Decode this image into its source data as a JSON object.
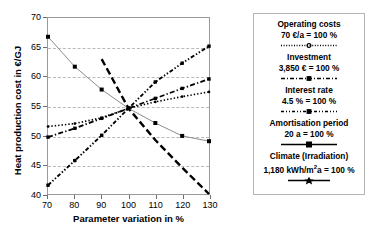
{
  "chart_data": {
    "type": "line",
    "title": "",
    "xlabel": "Parameter variation in %",
    "ylabel": "Heat production cost in €/GJ",
    "xlim": [
      70,
      130
    ],
    "ylim": [
      40,
      70
    ],
    "xticks": [
      70,
      80,
      90,
      100,
      110,
      120,
      130
    ],
    "yticks": [
      40,
      45,
      50,
      55,
      60,
      65,
      70
    ],
    "grid": "horizontal-dashed",
    "legend_position": "right-outside",
    "x": [
      70,
      80,
      90,
      100,
      110,
      120,
      130
    ],
    "series": [
      {
        "name": "Operating costs",
        "reference": "70 €/a = 100 %",
        "style": "dotted",
        "marker": "small-diamond",
        "values": [
          51.5,
          52.0,
          53.0,
          54.6,
          55.7,
          56.6,
          57.4
        ]
      },
      {
        "name": "Investment",
        "reference": "3,850 € = 100 %",
        "style": "dash-dot",
        "marker": "square",
        "values": [
          49.7,
          51.2,
          52.9,
          54.6,
          56.3,
          58.0,
          59.6
        ]
      },
      {
        "name": "Interest rate",
        "reference": "4.5 % = 100 %",
        "style": "long-dash",
        "marker": "none",
        "values": [
          63.0,
          63.0,
          63.0,
          54.6,
          49.2,
          44.5,
          40.0
        ]
      },
      {
        "name": "Amortisation period",
        "reference": "20 a = 100 %",
        "style": "dash-dot-dot",
        "marker": "square",
        "values": [
          41.5,
          45.7,
          50.0,
          54.6,
          59.1,
          62.3,
          65.2
        ]
      },
      {
        "name": "Climate (Irradiation)",
        "reference": "1,180 kWh/m²a  = 100 %",
        "style": "solid",
        "marker": "square",
        "values": [
          66.8,
          61.7,
          57.8,
          54.6,
          52.1,
          49.9,
          49.0
        ]
      }
    ]
  },
  "axes": {
    "y_title": "Heat production cost in €/GJ",
    "x_title": "Parameter variation in %",
    "y_tick_labels": [
      "40",
      "45",
      "50",
      "55",
      "60",
      "65",
      "70"
    ],
    "x_tick_labels": [
      "70",
      "80",
      "90",
      "100",
      "110",
      "120",
      "130"
    ]
  },
  "legend": {
    "entries": [
      {
        "title": "Operating costs",
        "value": "70 €/a = 100 %"
      },
      {
        "title": "Investment",
        "value": "3,850 € = 100 %"
      },
      {
        "title": "Interest rate",
        "value": "4.5 % = 100 %"
      },
      {
        "title": "Amortisation period",
        "value": "20 a = 100 %"
      },
      {
        "title": "Climate (Irradiation)",
        "value_pre": "1,180 kWh/m",
        "value_sup": "2",
        "value_post": "a  = 100 %"
      }
    ]
  },
  "colors": {
    "line": "#000000",
    "climate_line": "#8c8c8c",
    "grid": "#b9b9b9",
    "frame": "#9a9a9a",
    "background": "#ffffff"
  }
}
